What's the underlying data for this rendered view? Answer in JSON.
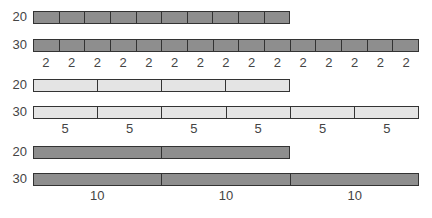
{
  "chart_data": {
    "type": "bar-model",
    "title": "",
    "groups": [
      {
        "unit": 2,
        "rows": [
          {
            "label": "20",
            "cells": 10
          },
          {
            "label": "30",
            "cells": 15
          }
        ],
        "unit_labels": [
          "2",
          "2",
          "2",
          "2",
          "2",
          "2",
          "2",
          "2",
          "2",
          "2",
          "2",
          "2",
          "2",
          "2",
          "2"
        ]
      },
      {
        "unit": 5,
        "rows": [
          {
            "label": "20",
            "cells": 4
          },
          {
            "label": "30",
            "cells": 6
          }
        ],
        "unit_labels": [
          "5",
          "5",
          "5",
          "5",
          "5",
          "5"
        ]
      },
      {
        "unit": 10,
        "rows": [
          {
            "label": "20",
            "cells": 2
          },
          {
            "label": "30",
            "cells": 3
          }
        ],
        "unit_labels": [
          "10",
          "10",
          "10"
        ]
      }
    ],
    "colors": {
      "group1": "#8e8e8e",
      "group2": "#e4e4e4",
      "group3": "#8e8e8e",
      "border": "#333333"
    }
  },
  "labels": {
    "g1r1": "20",
    "g1r2": "30",
    "g2r1": "20",
    "g2r2": "30",
    "g3r1": "20",
    "g3r2": "30",
    "u2": "2",
    "u5": "5",
    "u10": "10"
  }
}
